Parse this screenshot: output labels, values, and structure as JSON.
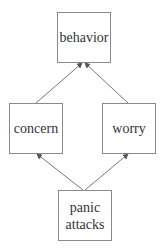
{
  "diagram": {
    "nodes": [
      {
        "id": "behavior",
        "label": "behavior"
      },
      {
        "id": "concern",
        "label": "concern"
      },
      {
        "id": "worry",
        "label": "worry"
      },
      {
        "id": "panic_attacks",
        "label": "panic attacks"
      }
    ],
    "edges": [
      {
        "from": "concern",
        "to": "behavior"
      },
      {
        "from": "worry",
        "to": "behavior"
      },
      {
        "from": "panic_attacks",
        "to": "concern"
      },
      {
        "from": "panic_attacks",
        "to": "worry"
      }
    ],
    "colors": {
      "border": "#8a8a8a",
      "edge": "#777777",
      "text": "#333333"
    }
  }
}
